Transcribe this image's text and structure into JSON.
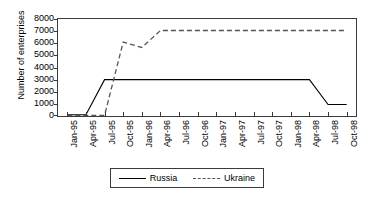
{
  "chart_data": {
    "type": "line",
    "title": "",
    "xlabel": "",
    "ylabel": "Number of enterprises",
    "ylim": [
      0,
      8000
    ],
    "ytick_step": 1000,
    "yticks": [
      0,
      1000,
      2000,
      3000,
      4000,
      5000,
      6000,
      7000,
      8000
    ],
    "grid": false,
    "legend_position": "bottom-center",
    "categories": [
      "Jan-95",
      "Apr-95",
      "Jul-95",
      "Oct-95",
      "Jan-96",
      "Apr-96",
      "Jul-96",
      "Oct-96",
      "Jan-97",
      "Apr-97",
      "Jul-97",
      "Oct-97",
      "Jan-98",
      "Apr-98",
      "Jul-98",
      "Oct-98"
    ],
    "series": [
      {
        "name": "Russia",
        "style": "solid",
        "color": "#000000",
        "values": [
          100,
          100,
          3000,
          3000,
          3000,
          3000,
          3000,
          3000,
          3000,
          3000,
          3000,
          3000,
          3000,
          3000,
          950,
          950
        ]
      },
      {
        "name": "Ukraine",
        "style": "dashed",
        "color": "#555555",
        "values": [
          50,
          50,
          50,
          6100,
          5650,
          7050,
          7050,
          7050,
          7050,
          7050,
          7050,
          7050,
          7050,
          7050,
          7050,
          7050
        ]
      }
    ]
  },
  "legend": {
    "items": [
      {
        "label": "Russia",
        "style": "solid"
      },
      {
        "label": "Ukraine",
        "style": "dashed"
      }
    ]
  }
}
